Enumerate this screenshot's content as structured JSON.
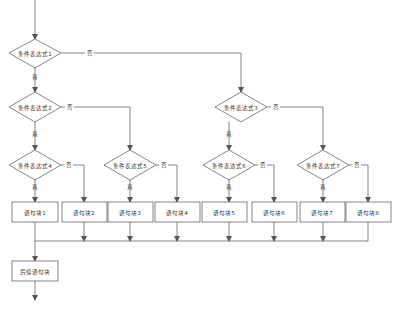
{
  "diagram": {
    "type": "flowchart",
    "colors": {
      "stroke": "#666666",
      "fill": "#ffffff",
      "text": "#333333"
    },
    "conditions": [
      {
        "id": "c1",
        "label": "条件表达式1"
      },
      {
        "id": "c2",
        "label": "条件表达式2"
      },
      {
        "id": "c3",
        "label": "条件表达式3"
      },
      {
        "id": "c4",
        "label": "条件表达式4"
      },
      {
        "id": "c5",
        "label": "条件表达式5"
      },
      {
        "id": "c6",
        "label": "条件表达式6"
      },
      {
        "id": "c7",
        "label": "条件表达式7"
      }
    ],
    "blocks": [
      {
        "id": "b1",
        "label": "语句块1"
      },
      {
        "id": "b2",
        "label": "语句块2"
      },
      {
        "id": "b3",
        "label": "语句块3"
      },
      {
        "id": "b4",
        "label": "语句块4"
      },
      {
        "id": "b5",
        "label": "语句块5"
      },
      {
        "id": "b6",
        "label": "语句块6"
      },
      {
        "id": "b7",
        "label": "语句块7"
      },
      {
        "id": "b8",
        "label": "语句块8"
      }
    ],
    "final_block": {
      "id": "after",
      "label": "后续语句块"
    },
    "edge_labels": {
      "true": "真",
      "false": "否"
    }
  }
}
